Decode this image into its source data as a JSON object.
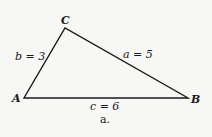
{
  "figure": {
    "caption": "a.",
    "vertices": {
      "A": {
        "label": "A",
        "x": 24,
        "y": 98
      },
      "B": {
        "label": "B",
        "x": 188,
        "y": 98
      },
      "C": {
        "label": "C",
        "x": 65,
        "y": 28
      }
    },
    "sides": {
      "a": {
        "label": "a = 5"
      },
      "b": {
        "label": "b = 3"
      },
      "c": {
        "label": "c = 6"
      }
    },
    "colors": {
      "stroke": "#1a1a1a",
      "background": "#f7f7f5"
    }
  }
}
